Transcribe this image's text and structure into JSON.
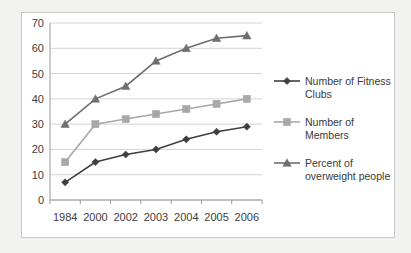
{
  "chart_data": {
    "type": "line",
    "title": "",
    "xlabel": "",
    "ylabel": "",
    "categories": [
      "1984",
      "2000",
      "2002",
      "2003",
      "2004",
      "2005",
      "2006"
    ],
    "ylim": [
      0,
      70
    ],
    "yticks": [
      0,
      10,
      20,
      30,
      40,
      50,
      60,
      70
    ],
    "grid": true,
    "legend_position": "right",
    "series": [
      {
        "name": "Number of Fitness Clubs",
        "marker": "diamond",
        "color": "#3f3f3f",
        "values": [
          7,
          15,
          18,
          20,
          24,
          27,
          29
        ]
      },
      {
        "name": "Number of Members",
        "marker": "square",
        "color": "#a8a8a8",
        "values": [
          15,
          30,
          32,
          34,
          36,
          38,
          40
        ]
      },
      {
        "name": "Percent of overweight people",
        "marker": "triangle",
        "color": "#6e6e6e",
        "values": [
          30,
          40,
          45,
          55,
          60,
          64,
          65
        ]
      }
    ]
  },
  "legend": {
    "entries": [
      {
        "label_line1": "Number of Fitness",
        "label_line2": "Clubs"
      },
      {
        "label_line1": "Number of",
        "label_line2": "Members"
      },
      {
        "label_line1": "Percent of",
        "label_line2": "overweight people"
      }
    ]
  },
  "axis": {
    "y_tick_labels": [
      "70",
      "60",
      "50",
      "40",
      "30",
      "20",
      "10",
      "0"
    ],
    "x_tick_labels": [
      "1984",
      "2000",
      "2002",
      "2003",
      "2004",
      "2005",
      "2006"
    ]
  },
  "colors": {
    "background": "#f2f2f0",
    "panel": "#ffffff",
    "frame_border": "#c9c9c9",
    "gridline": "#d4d4d4",
    "axis_line": "#9a9a9a",
    "series_fitness_clubs": "#3f3f3f",
    "series_members": "#a8a8a8",
    "series_overweight": "#6e6e6e",
    "text": "#404040"
  }
}
